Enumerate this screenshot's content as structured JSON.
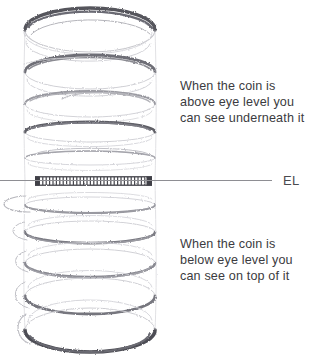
{
  "figure": {
    "medium": "pencil sketch",
    "background_color": "#ffffff",
    "graphite_dark": "#4a4a50",
    "graphite_mid": "#8a8a90",
    "graphite_light": "#c3c3c8"
  },
  "eye_level": {
    "label": "EL",
    "line_color": "#8e8e93",
    "line_y": 180,
    "line_start_x": 0,
    "line_end_x": 272
  },
  "captions": {
    "above": {
      "lines": [
        "When the coin is",
        "above eye level you",
        "can see underneath it"
      ]
    },
    "below": {
      "lines": [
        "When the coin is",
        "below eye level you",
        "can see on top of it"
      ]
    }
  },
  "coins": [
    {
      "index": 0,
      "cy": 30,
      "rx": 65,
      "ry": 22,
      "position": "above",
      "shaded_arc": "top",
      "tone": "#55555c"
    },
    {
      "index": 1,
      "cy": 72,
      "rx": 65,
      "ry": 17,
      "position": "above",
      "shaded_arc": "top",
      "tone": "#6e6e76"
    },
    {
      "index": 2,
      "cy": 104,
      "rx": 65,
      "ry": 13,
      "position": "above",
      "shaded_arc": "top",
      "tone": "#8a8a92"
    },
    {
      "index": 3,
      "cy": 132,
      "rx": 65,
      "ry": 10,
      "position": "above",
      "shaded_arc": "top",
      "tone": "#5e5e66"
    },
    {
      "index": 4,
      "cy": 158,
      "rx": 65,
      "ry": 7,
      "position": "above",
      "shaded_arc": "top",
      "tone": "#a5a5ac"
    },
    {
      "index": 5,
      "cy": 181,
      "rx": 58,
      "ry": 0,
      "position": "at",
      "shaded_arc": "edge",
      "tone": "#4a4a50"
    },
    {
      "index": 6,
      "cy": 205,
      "rx": 65,
      "ry": 8,
      "position": "below",
      "shaded_arc": "bottom",
      "tone": "#9a9aa1"
    },
    {
      "index": 7,
      "cy": 232,
      "rx": 65,
      "ry": 11,
      "position": "below",
      "shaded_arc": "bottom",
      "tone": "#7c7c84"
    },
    {
      "index": 8,
      "cy": 263,
      "rx": 65,
      "ry": 14,
      "position": "below",
      "shaded_arc": "bottom",
      "tone": "#8a8a92"
    },
    {
      "index": 9,
      "cy": 296,
      "rx": 65,
      "ry": 18,
      "position": "below",
      "shaded_arc": "bottom",
      "tone": "#76767e"
    },
    {
      "index": 10,
      "cy": 330,
      "rx": 65,
      "ry": 22,
      "position": "below",
      "shaded_arc": "bottom",
      "tone": "#4e4e55"
    }
  ],
  "edge_coin": {
    "x_start": 35,
    "x_end": 152,
    "y": 181,
    "thickness": 9,
    "hatch_count": 34,
    "hatch_color": "#4a4a50"
  }
}
